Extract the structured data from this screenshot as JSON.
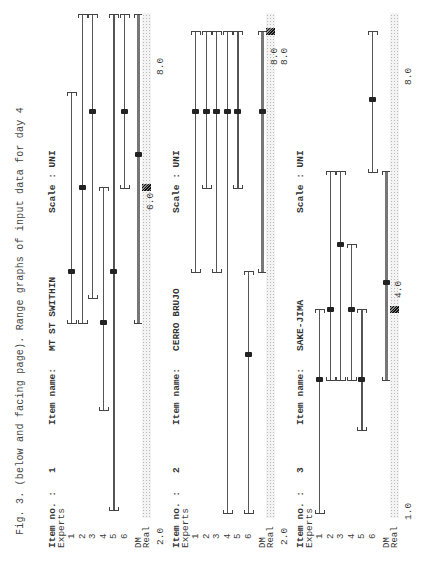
{
  "caption": "Fig. 3. (below and facing page). Range graphs of input data for day 4",
  "labels": {
    "item_no": "Item no. :",
    "item_name": "Item name:",
    "scale": "Scale : UNI",
    "experts": "Experts",
    "dm": "DM",
    "real": "Real",
    "expert_ids": [
      "1",
      "2",
      "3",
      "4",
      "5",
      "6"
    ]
  },
  "panels": [
    {
      "item_no": "1",
      "item_name": "MT ST SWITHIN",
      "scale": "UNI",
      "ranges": [
        {
          "from": 250,
          "mid": 301,
          "to": 480
        },
        {
          "from": 250,
          "mid": 385,
          "to": 558
        },
        {
          "from": 275,
          "mid": 461,
          "to": 558
        },
        {
          "from": 163,
          "mid": 250,
          "to": 385
        },
        {
          "from": 63,
          "mid": 301,
          "to": 558
        },
        {
          "from": 385,
          "mid": 461,
          "to": 558
        }
      ],
      "dm": {
        "from": 250,
        "mid": 418,
        "to": 558
      },
      "real_x": 385,
      "ticks": [
        {
          "label": "2.0",
          "x": 28,
          "dy": 0
        },
        {
          "label": "6.0",
          "x": 363,
          "dy": -10
        },
        {
          "label": "8.0",
          "x": 498,
          "dy": 0
        }
      ]
    },
    {
      "item_no": "2",
      "item_name": "CERRO BRUJO",
      "scale": "UNI",
      "ranges": [
        {
          "from": 301,
          "mid": 461,
          "to": 541
        },
        {
          "from": 385,
          "mid": 461,
          "to": 541
        },
        {
          "from": 301,
          "mid": 461,
          "to": 541
        },
        {
          "from": 60,
          "mid": 461,
          "to": 541
        },
        {
          "from": 385,
          "mid": 461,
          "to": 541
        },
        {
          "from": 60,
          "mid": 218,
          "to": 301
        }
      ],
      "dm": {
        "from": 301,
        "mid": 461,
        "to": 541
      },
      "real_x": 541,
      "ticks": [
        {
          "label": "2.0",
          "x": 28,
          "dy": 0
        },
        {
          "label": "8.0",
          "x": 508,
          "dy": -10
        },
        {
          "label": "8.0",
          "x": 508,
          "dy": 0
        }
      ]
    },
    {
      "item_no": "3",
      "item_name": "SAKE-JIMA",
      "scale": "UNI",
      "ranges": [
        {
          "from": 60,
          "mid": 193,
          "to": 263
        },
        {
          "from": 193,
          "mid": 263,
          "to": 401
        },
        {
          "from": 193,
          "mid": 328,
          "to": 401
        },
        {
          "from": 193,
          "mid": 263,
          "to": 328
        },
        {
          "from": 143,
          "mid": 193,
          "to": 263
        },
        {
          "from": 401,
          "mid": 473,
          "to": 541
        }
      ],
      "dm": {
        "from": 193,
        "mid": 290,
        "to": 401
      },
      "real_x": 263,
      "ticks": [
        {
          "label": "4.0",
          "x": 275,
          "dy": -10
        },
        {
          "label": "1.0",
          "x": 53,
          "dy": 0
        },
        {
          "label": "8.0",
          "x": 488,
          "dy": 0
        }
      ]
    }
  ],
  "chart_data": [
    {
      "type": "range",
      "title": "Item no. 1 — MT ST SWITHIN (Scale: UNI)",
      "xlabel": "",
      "ylabel": "",
      "categories": [
        "Expert 1",
        "Expert 2",
        "Expert 3",
        "Expert 4",
        "Expert 5",
        "Expert 6",
        "DM"
      ],
      "series": [
        {
          "name": "lower (5%)",
          "values": [
            4.5,
            4.5,
            4.8,
            3.5,
            2.4,
            6.0,
            4.5
          ]
        },
        {
          "name": "median (50%)",
          "values": [
            5.1,
            6.0,
            6.9,
            4.5,
            5.1,
            6.9,
            6.4
          ]
        },
        {
          "name": "upper (95%)",
          "values": [
            7.1,
            8.0,
            8.0,
            6.0,
            8.0,
            8.0,
            8.0
          ]
        }
      ],
      "realization": 6.0,
      "axis_labels": [
        "2.0",
        "6.0",
        "8.0"
      ],
      "xlim": [
        2.0,
        8.0
      ]
    },
    {
      "type": "range",
      "title": "Item no. 2 — CERRO BRUJO (Scale: UNI)",
      "xlabel": "",
      "ylabel": "",
      "categories": [
        "Expert 1",
        "Expert 2",
        "Expert 3",
        "Expert 4",
        "Expert 5",
        "Expert 6",
        "DM"
      ],
      "series": [
        {
          "name": "lower (5%)",
          "values": [
            5.2,
            6.2,
            5.2,
            2.4,
            6.2,
            2.4,
            5.2
          ]
        },
        {
          "name": "median (50%)",
          "values": [
            7.1,
            7.1,
            7.1,
            7.1,
            7.1,
            4.2,
            7.1
          ]
        },
        {
          "name": "upper (95%)",
          "values": [
            8.0,
            8.0,
            8.0,
            8.0,
            8.0,
            5.2,
            8.0
          ]
        }
      ],
      "realization": 8.0,
      "axis_labels": [
        "2.0",
        "8.0",
        "8.0"
      ],
      "xlim": [
        2.0,
        8.0
      ]
    },
    {
      "type": "range",
      "title": "Item no. 3 — SAKE-JIMA (Scale: UNI)",
      "xlabel": "",
      "ylabel": "",
      "categories": [
        "Expert 1",
        "Expert 2",
        "Expert 3",
        "Expert 4",
        "Expert 5",
        "Expert 6",
        "DM"
      ],
      "series": [
        {
          "name": "lower (5%)",
          "values": [
            1.0,
            3.1,
            3.1,
            3.1,
            2.3,
            6.4,
            3.1
          ]
        },
        {
          "name": "median (50%)",
          "values": [
            3.1,
            4.2,
            5.3,
            4.2,
            3.1,
            7.6,
            4.7
          ]
        },
        {
          "name": "upper (95%)",
          "values": [
            4.2,
            6.4,
            6.4,
            5.3,
            4.2,
            8.7,
            6.4
          ]
        }
      ],
      "realization": 4.2,
      "axis_labels": [
        "2.0",
        "1.0",
        "4.0",
        "8.0"
      ],
      "xlim": [
        1.0,
        8.0
      ]
    }
  ]
}
